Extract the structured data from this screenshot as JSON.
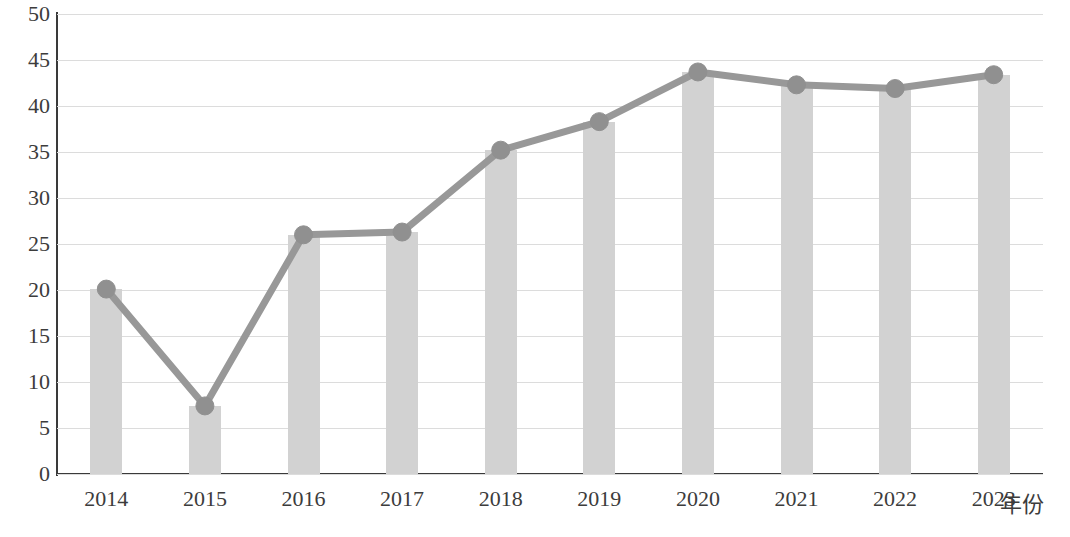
{
  "chart_data": {
    "type": "bar",
    "title": "",
    "subtitle": "",
    "xlabel": "年份",
    "ylabel": "",
    "categories": [
      "2014",
      "2015",
      "2016",
      "2017",
      "2018",
      "2019",
      "2020",
      "2021",
      "2022",
      "2023"
    ],
    "series": [
      {
        "name": "bars",
        "type": "bar",
        "values": [
          20.1,
          7.4,
          26.0,
          26.3,
          35.2,
          38.3,
          43.7,
          42.3,
          41.9,
          43.4
        ]
      },
      {
        "name": "line",
        "type": "line",
        "values": [
          20.1,
          7.4,
          26.0,
          26.3,
          35.2,
          38.3,
          43.7,
          42.3,
          41.9,
          43.4
        ]
      }
    ],
    "values": [
      20.1,
      7.4,
      26.0,
      26.3,
      35.2,
      38.3,
      43.7,
      42.3,
      41.9,
      43.4
    ],
    "ylim": [
      0,
      50
    ],
    "yticks": [
      0,
      5,
      10,
      15,
      20,
      25,
      30,
      35,
      40,
      45,
      50
    ],
    "ytick_labels": [
      "0",
      "5",
      "10",
      "15",
      "20",
      "25",
      "30",
      "35",
      "40",
      "45",
      "50"
    ],
    "grid": true,
    "grid_axis": "y",
    "legend": false,
    "legend_position": "none",
    "colors": {
      "bar": "#d2d2d2",
      "line": "#989898",
      "marker": "#909090",
      "grid": "#dcdcdc",
      "axis": "#3a3a3a",
      "text": "#3c3c3c",
      "background": "#ffffff"
    }
  }
}
